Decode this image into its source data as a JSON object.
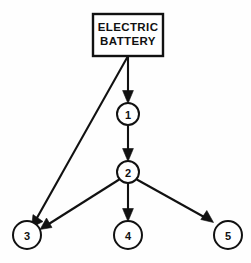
{
  "diagram": {
    "background_color": "#fefefe",
    "stroke_color": "#111111",
    "fill_color": "#ffffff",
    "canvas": {
      "width": 251,
      "height": 263
    },
    "source_box": {
      "name": "electric-battery",
      "line1": "ELECTRIC",
      "line2": "BATTERY",
      "x": 93,
      "y": 14,
      "width": 70,
      "height": 42
    },
    "nodes": [
      {
        "id": "1",
        "label": "1",
        "cx": 128,
        "cy": 114,
        "r": 11
      },
      {
        "id": "2",
        "label": "2",
        "cx": 128,
        "cy": 172,
        "r": 11
      },
      {
        "id": "3",
        "label": "3",
        "cx": 27,
        "cy": 235,
        "r": 14
      },
      {
        "id": "4",
        "label": "4",
        "cx": 128,
        "cy": 235,
        "r": 14
      },
      {
        "id": "5",
        "label": "5",
        "cx": 228,
        "cy": 235,
        "r": 14
      }
    ],
    "edges": [
      {
        "id": "battery-to-1",
        "from": "electric-battery",
        "to": "1",
        "x1": 128,
        "y1": 56,
        "x2": 128,
        "y2": 101
      },
      {
        "id": "battery-to-3",
        "from": "electric-battery",
        "to": "3",
        "x1": 128,
        "y1": 56,
        "x2": 34,
        "y2": 223
      },
      {
        "id": "1-to-2",
        "from": "1",
        "to": "2",
        "x1": 128,
        "y1": 125,
        "x2": 128,
        "y2": 159
      },
      {
        "id": "2-to-3",
        "from": "2",
        "to": "3",
        "x1": 120,
        "y1": 180,
        "x2": 40,
        "y2": 228
      },
      {
        "id": "2-to-4",
        "from": "2",
        "to": "4",
        "x1": 128,
        "y1": 183,
        "x2": 128,
        "y2": 220
      },
      {
        "id": "2-to-5",
        "from": "2",
        "to": "5",
        "x1": 137,
        "y1": 180,
        "x2": 214,
        "y2": 223
      }
    ]
  }
}
